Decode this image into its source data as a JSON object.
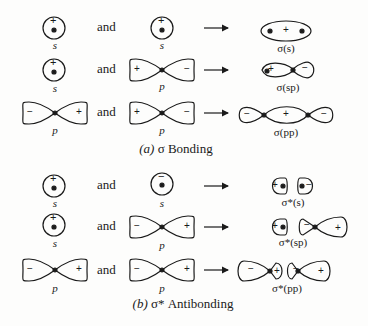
{
  "figure": {
    "section_a": {
      "caption_prefix": "(a)",
      "caption_text": "σ Bonding",
      "rows": [
        {
          "left": {
            "type": "s",
            "label": "s",
            "sign": "+"
          },
          "connector": "and",
          "right": {
            "type": "s",
            "label": "s",
            "sign": "+"
          },
          "result": {
            "label": "σ(s)",
            "signs": [
              "+"
            ]
          }
        },
        {
          "left": {
            "type": "s",
            "label": "s",
            "sign": "+"
          },
          "connector": "and",
          "right": {
            "type": "p",
            "label": "p",
            "signs": [
              "+",
              "−"
            ]
          },
          "result": {
            "label": "σ(sp)",
            "signs": [
              "+",
              "−"
            ]
          }
        },
        {
          "left": {
            "type": "p",
            "label": "p",
            "signs": [
              "−",
              "+"
            ]
          },
          "connector": "and",
          "right": {
            "type": "p",
            "label": "p",
            "signs": [
              "+",
              "−"
            ]
          },
          "result": {
            "label": "σ(pp)",
            "signs": [
              "−",
              "+",
              "−"
            ]
          }
        }
      ]
    },
    "section_b": {
      "caption_prefix": "(b)",
      "caption_text": "σ* Antibonding",
      "rows": [
        {
          "left": {
            "type": "s",
            "label": "s",
            "sign": "+"
          },
          "connector": "and",
          "right": {
            "type": "s",
            "label": "s",
            "sign": "−"
          },
          "result": {
            "label": "σ*(s)",
            "signs": [
              "+",
              "−"
            ]
          }
        },
        {
          "left": {
            "type": "s",
            "label": "s",
            "sign": "+"
          },
          "connector": "and",
          "right": {
            "type": "p",
            "label": "p",
            "signs": [
              "−",
              "+"
            ]
          },
          "result": {
            "label": "σ*(sp)",
            "signs": [
              "+",
              "−",
              "+"
            ]
          }
        },
        {
          "left": {
            "type": "p",
            "label": "p",
            "signs": [
              "−",
              "+"
            ]
          },
          "connector": "and",
          "right": {
            "type": "p",
            "label": "p",
            "signs": [
              "−",
              "+"
            ]
          },
          "result": {
            "label": "σ*(pp)",
            "signs": [
              "−",
              "+",
              "−",
              "+"
            ]
          }
        }
      ]
    },
    "colors": {
      "ink": "#1a1a1a",
      "background": "#fdfdfc"
    }
  }
}
